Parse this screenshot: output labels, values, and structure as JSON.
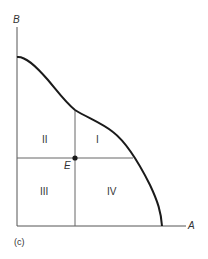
{
  "diagram": {
    "type": "production-possibility-frontier",
    "axes": {
      "x_label": "A",
      "y_label": "B"
    },
    "point": {
      "label": "E"
    },
    "quadrants": [
      {
        "id": "I",
        "label": "I",
        "position": "upper-right"
      },
      {
        "id": "II",
        "label": "II",
        "position": "upper-left"
      },
      {
        "id": "III",
        "label": "III",
        "position": "lower-left"
      },
      {
        "id": "IV",
        "label": "IV",
        "position": "lower-right"
      }
    ],
    "caption": "(c)",
    "colors": {
      "curve": "#1a1a1a",
      "axes": "#555555",
      "guides": "#666666",
      "point": "#1a1a1a",
      "text": "#333333"
    }
  }
}
